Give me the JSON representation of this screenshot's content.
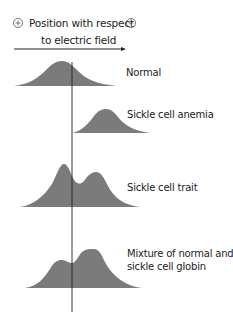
{
  "header": {
    "line1": "Position with respect",
    "line2": "to electric field",
    "positive_symbol": "+",
    "negative_symbol": "−"
  },
  "profiles": [
    {
      "id": "normal",
      "label": "Normal"
    },
    {
      "id": "sickle-cell-anemia",
      "label": "Sickle cell anemia"
    },
    {
      "id": "sickle-cell-trait",
      "label": "Sickle cell trait"
    },
    {
      "id": "mixture",
      "label_line1": "Mixture of normal and",
      "label_line2": "sickle cell globin"
    }
  ],
  "colors": {
    "peak_fill": "#7b7b7b",
    "line": "#222222",
    "text": "#222222"
  }
}
